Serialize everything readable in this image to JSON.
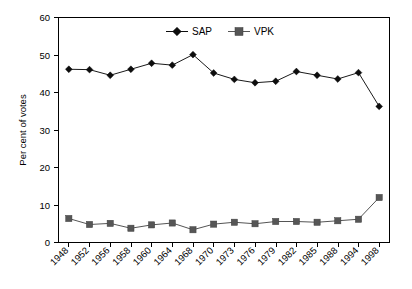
{
  "chart_data": {
    "type": "line",
    "title": "",
    "xlabel": "",
    "ylabel": "Per cent of votes",
    "ylim": [
      0,
      60
    ],
    "yticks": [
      0,
      10,
      20,
      30,
      40,
      50,
      60
    ],
    "ytick_labels": [
      "0",
      "10",
      "20",
      "30",
      "40",
      "50",
      "60"
    ],
    "grid": false,
    "legend_position": "top-center",
    "categories": [
      "1948",
      "1952",
      "1956",
      "1958",
      "1960",
      "1964",
      "1968",
      "1970",
      "1973",
      "1976",
      "1979",
      "1982",
      "1985",
      "1988",
      "1994",
      "1998"
    ],
    "series": [
      {
        "name": "SAP",
        "marker": "diamond",
        "color": "#0d0d0d",
        "values": [
          46.2,
          46.1,
          44.6,
          46.2,
          47.8,
          47.3,
          50.1,
          45.2,
          43.5,
          42.6,
          43.0,
          45.6,
          44.6,
          43.6,
          45.3,
          36.3
        ]
      },
      {
        "name": "VPK",
        "marker": "square",
        "color": "#565656",
        "values": [
          6.4,
          4.8,
          5.1,
          3.8,
          4.7,
          5.2,
          3.4,
          4.9,
          5.4,
          5.0,
          5.6,
          5.6,
          5.4,
          5.8,
          6.2,
          12.0
        ]
      }
    ]
  },
  "legend": {
    "entries": [
      {
        "label": "SAP",
        "marker": "diamond-marker"
      },
      {
        "label": "VPK",
        "marker": "square-marker"
      }
    ]
  },
  "axes": {
    "y_title": "Per cent of votes",
    "y_labels": [
      "60",
      "50",
      "40",
      "30",
      "20",
      "10",
      "0"
    ],
    "x_labels": [
      "1948",
      "1952",
      "1956",
      "1958",
      "1960",
      "1964",
      "1968",
      "1970",
      "1973",
      "1976",
      "1979",
      "1982",
      "1985",
      "1988",
      "1994",
      "1998"
    ]
  },
  "colors": {
    "sap": "#0d0d0d",
    "vpk": "#565656",
    "axis": "#000000",
    "background": "#ffffff"
  }
}
